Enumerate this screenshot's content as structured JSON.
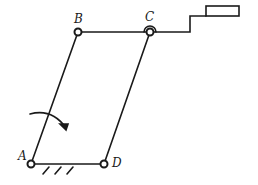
{
  "diagram": {
    "type": "four-bar linkage",
    "joints": {
      "A": {
        "label": "A",
        "x": 31,
        "y": 164
      },
      "B": {
        "label": "B",
        "x": 78,
        "y": 32
      },
      "C": {
        "label": "C",
        "x": 150,
        "y": 32
      },
      "D": {
        "label": "D",
        "x": 104,
        "y": 164
      }
    },
    "links": [
      {
        "from": "A",
        "to": "B"
      },
      {
        "from": "B",
        "to": "C"
      },
      {
        "from": "C",
        "to": "D"
      },
      {
        "from": "A",
        "to": "D",
        "grounded": true
      }
    ],
    "annotations": {
      "rotation_arrow": "clockwise arrow on link AB",
      "ground_hatch": "fixed ground under AD",
      "slider_block": "rectangle attached to C via stepped rod"
    },
    "stroke_color": "#1a1a1a"
  }
}
